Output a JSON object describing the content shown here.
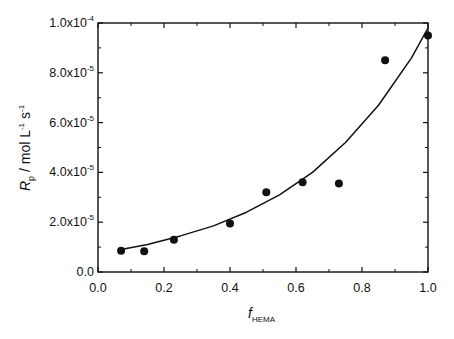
{
  "chart_data": {
    "type": "scatter",
    "title": "",
    "xlabel": "f_HEMA",
    "xlabel_main": "f",
    "xlabel_sub": "HEMA",
    "ylabel": "R_p / mol L^-1 s^-1",
    "ylabel_main": "R",
    "ylabel_sub": "p",
    "ylabel_rest": " / mol L",
    "ylabel_sup1": "-1",
    "ylabel_s": " s",
    "ylabel_sup2": "-1",
    "xlim": [
      0.0,
      1.0
    ],
    "ylim": [
      0.0,
      0.0001
    ],
    "xticks": [
      "0.0",
      "0.2",
      "0.4",
      "0.6",
      "0.8",
      "1.0"
    ],
    "yticks": [
      {
        "mant": "0.0",
        "exp": ""
      },
      {
        "mant": "2.0x10",
        "exp": "-5"
      },
      {
        "mant": "4.0x10",
        "exp": "-5"
      },
      {
        "mant": "6.0x10",
        "exp": "-5"
      },
      {
        "mant": "8.0x10",
        "exp": "-5"
      },
      {
        "mant": "1.0x10",
        "exp": "-4"
      }
    ],
    "grid": false,
    "legend": null,
    "series": [
      {
        "name": "experimental",
        "marker": "filled-circle",
        "x": [
          0.07,
          0.14,
          0.23,
          0.4,
          0.51,
          0.62,
          0.73,
          0.87,
          1.0
        ],
        "y": [
          8.5e-06,
          8.3e-06,
          1.3e-05,
          1.95e-05,
          3.2e-05,
          3.6e-05,
          3.55e-05,
          8.5e-05,
          9.5e-05
        ]
      },
      {
        "name": "fit",
        "style": "line",
        "x": [
          0.07,
          0.15,
          0.25,
          0.35,
          0.45,
          0.55,
          0.65,
          0.75,
          0.85,
          0.95,
          1.0
        ],
        "y": [
          9e-06,
          1.1e-05,
          1.45e-05,
          1.85e-05,
          2.4e-05,
          3.1e-05,
          4e-05,
          5.2e-05,
          6.7e-05,
          8.6e-05,
          9.8e-05
        ]
      }
    ]
  }
}
